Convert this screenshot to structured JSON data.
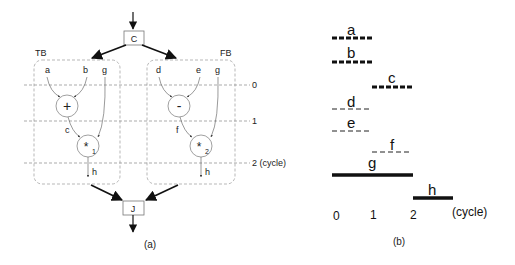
{
  "diagram_a": {
    "caption": "(a)",
    "top_node": "C",
    "bottom_node": "J",
    "cycle_labels": [
      "0",
      "1",
      "2 (cycle)"
    ],
    "true_branch": {
      "label": "TB",
      "inputs": [
        "a",
        "b",
        "g"
      ],
      "op1": "+",
      "op1_out": "c",
      "op2": "*",
      "op2_sub": "1",
      "output": "h"
    },
    "false_branch": {
      "label": "FB",
      "inputs": [
        "d",
        "e",
        "g"
      ],
      "op1": "-",
      "op1_out": "f",
      "op2": "*",
      "op2_sub": "2",
      "output": "h"
    }
  },
  "diagram_b": {
    "caption": "(b)",
    "axis_labels": [
      "0",
      "1",
      "2"
    ],
    "axis_unit": "(cycle)",
    "lifetimes": [
      {
        "name": "a",
        "start": 0,
        "end": 1,
        "style": "thick-dashed"
      },
      {
        "name": "b",
        "start": 0,
        "end": 1,
        "style": "thick-dashed"
      },
      {
        "name": "c",
        "start": 1,
        "end": 2,
        "style": "thick-dashed"
      },
      {
        "name": "d",
        "start": 0,
        "end": 1,
        "style": "thin-dashed"
      },
      {
        "name": "e",
        "start": 0,
        "end": 1,
        "style": "thin-dashed"
      },
      {
        "name": "f",
        "start": 1,
        "end": 2,
        "style": "thin-dashed"
      },
      {
        "name": "g",
        "start": 0,
        "end": 2,
        "style": "solid"
      },
      {
        "name": "h",
        "start": 2,
        "end": 3,
        "style": "solid"
      }
    ]
  }
}
